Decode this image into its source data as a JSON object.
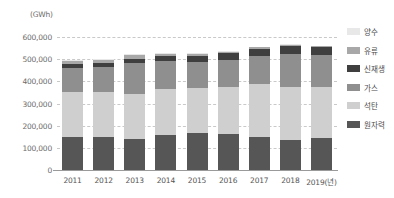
{
  "unit_label": "(GWh)",
  "legend": {
    "items": [
      {
        "label": "양수",
        "color": "#e8e8e8",
        "key": "pumped"
      },
      {
        "label": "유류",
        "color": "#a8a8a8",
        "key": "oil"
      },
      {
        "label": "신재생",
        "color": "#3f3f3f",
        "key": "renewable"
      },
      {
        "label": "가스",
        "color": "#8f8f8f",
        "key": "gas"
      },
      {
        "label": "석탄",
        "color": "#cfcfcf",
        "key": "coal"
      },
      {
        "label": "원자력",
        "color": "#565656",
        "key": "nuclear"
      }
    ]
  },
  "chart_data": {
    "type": "bar",
    "subtype": "stacked",
    "title": "",
    "xlabel": "(년)",
    "ylabel": "(GWh)",
    "ylim": [
      0,
      600000
    ],
    "ytick_values": [
      0,
      100000,
      200000,
      300000,
      400000,
      500000,
      600000
    ],
    "ytick_labels": [
      "0",
      "100,000",
      "200,000",
      "300,000",
      "400,000",
      "500,000",
      "600,000"
    ],
    "grid": true,
    "legend_position": "right",
    "categories": [
      "2011",
      "2012",
      "2013",
      "2014",
      "2015",
      "2016",
      "2017",
      "2018",
      "2019"
    ],
    "xtick_labels": [
      "2011",
      "2012",
      "2013",
      "2014",
      "2015",
      "2016",
      "2017",
      "2018",
      "2019(년)"
    ],
    "series": [
      {
        "name": "원자력",
        "color": "#565656",
        "values": [
          150000,
          150300,
          138800,
          156400,
          164800,
          162000,
          148400,
          133500,
          146000
        ]
      },
      {
        "name": "석탄",
        "color": "#cfcfcf",
        "values": [
          200200,
          200400,
          203500,
          207200,
          205000,
          213800,
          238800,
          239000,
          227400
        ]
      },
      {
        "name": "가스",
        "color": "#8f8f8f",
        "values": [
          110000,
          113000,
          139000,
          127600,
          118800,
          121000,
          126000,
          152900,
          144400
        ]
      },
      {
        "name": "신재생",
        "color": "#3f3f3f",
        "values": [
          17000,
          19000,
          21000,
          24000,
          27000,
          31000,
          35000,
          36000,
          37000
        ]
      },
      {
        "name": "유류",
        "color": "#a8a8a8",
        "values": [
          14000,
          15000,
          15500,
          8000,
          10000,
          6000,
          5000,
          4000,
          3000
        ]
      },
      {
        "name": "양수",
        "color": "#e8e8e8",
        "values": [
          3500,
          3600,
          4200,
          4600,
          3800,
          3800,
          4000,
          3900,
          3500
        ]
      }
    ],
    "totals": [
      494700,
      501300,
      522000,
      527800,
      529400,
      537600,
      557200,
      569300,
      561300
    ]
  }
}
